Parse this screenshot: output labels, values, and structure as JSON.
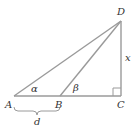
{
  "diagram": {
    "type": "right-triangle-geometry",
    "points": {
      "A": {
        "label": "A",
        "x": 14,
        "y": 96
      },
      "B": {
        "label": "B",
        "x": 60,
        "y": 96
      },
      "C": {
        "label": "C",
        "x": 121,
        "y": 96
      },
      "D": {
        "label": "D",
        "x": 121,
        "y": 21
      }
    },
    "angles": {
      "alpha": {
        "label": "α",
        "vertex": "A"
      },
      "beta": {
        "label": "β",
        "vertex": "B"
      }
    },
    "lengths": {
      "x": {
        "label": "x",
        "segment": "CD"
      },
      "d": {
        "label": "d",
        "segment": "AB"
      }
    },
    "right_angle_at": "C",
    "colors": {
      "line": "#9a9a9a",
      "text": "#333333",
      "background": "#ffffff"
    }
  }
}
